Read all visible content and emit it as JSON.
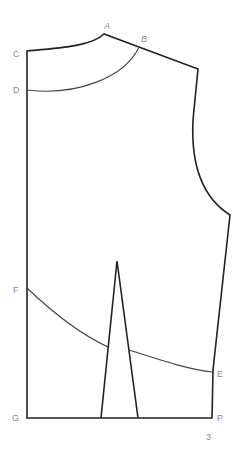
{
  "diagram": {
    "type": "bodice-pattern-draft",
    "labels": {
      "A": "A",
      "B": "B",
      "C": "C",
      "D": "D",
      "E": "E",
      "F": "F",
      "G": "G",
      "P": "P"
    },
    "page_number": "3",
    "colors": {
      "outline": "#222222",
      "guide": "#444444",
      "label": "#8a8a8a",
      "background": "#ffffff"
    }
  }
}
